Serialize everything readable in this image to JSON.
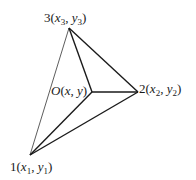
{
  "diagram": {
    "type": "triangle-with-interior-point",
    "colors": {
      "stroke": "#1a1a1a",
      "thin_stroke": "#333333",
      "background": "#ffffff"
    },
    "vertices": [
      {
        "id": "1",
        "num": "1",
        "x_var": "x",
        "y_var": "y",
        "sub": "1",
        "pos": [
          30,
          155
        ]
      },
      {
        "id": "2",
        "num": "2",
        "x_var": "x",
        "y_var": "y",
        "sub": "2",
        "pos": [
          138,
          92
        ]
      },
      {
        "id": "3",
        "num": "3",
        "x_var": "x",
        "y_var": "y",
        "sub": "3",
        "pos": [
          69,
          28
        ]
      }
    ],
    "interior_point": {
      "name": "O",
      "x_var": "x",
      "y_var": "y",
      "pos": [
        92,
        92
      ]
    },
    "labels": {
      "v1": {
        "num": "1",
        "open": "(",
        "x": "x",
        "sub": "1",
        "comma": ", ",
        "y": "y",
        "close": ")"
      },
      "v2": {
        "num": "2",
        "open": "(",
        "x": "x",
        "sub": "2",
        "comma": ", ",
        "y": "y",
        "close": ")"
      },
      "v3": {
        "num": "3",
        "open": "(",
        "x": "x",
        "sub": "3",
        "comma": ", ",
        "y": "y",
        "close": ")"
      },
      "o": {
        "name": "O",
        "open": "(",
        "x": "x",
        "comma": ", ",
        "y": "y",
        "close": ")"
      }
    },
    "edges": [
      {
        "from": "1",
        "to": "3",
        "weight": "thin"
      },
      {
        "from": "3",
        "to": "2",
        "weight": "bold"
      },
      {
        "from": "2",
        "to": "1",
        "weight": "bold"
      },
      {
        "from": "O",
        "to": "1",
        "weight": "bold"
      },
      {
        "from": "O",
        "to": "2",
        "weight": "bold"
      },
      {
        "from": "O",
        "to": "3",
        "weight": "bold"
      }
    ]
  }
}
